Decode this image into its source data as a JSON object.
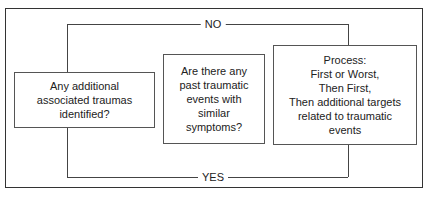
{
  "diagram": {
    "type": "flowchart",
    "boxes": [
      {
        "id": "box1",
        "text": "Any additional\nassociated traumas\nidentified?"
      },
      {
        "id": "box2",
        "text": "Are there any\npast traumatic\nevents with\nsimilar\nsymptoms?"
      },
      {
        "id": "box3",
        "text": "Process:\nFirst or Worst,\nThen First,\nThen additional targets\nrelated to traumatic\nevents"
      }
    ],
    "connectors": [
      {
        "from": "box1",
        "to": "box3",
        "label": "NO",
        "route": "top"
      },
      {
        "from": "box1",
        "to": "box3",
        "label": "YES",
        "route": "bottom"
      }
    ]
  }
}
